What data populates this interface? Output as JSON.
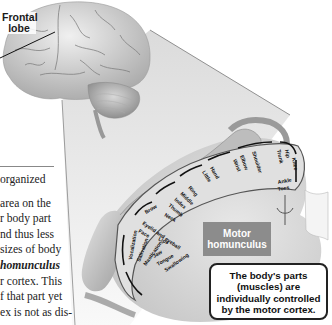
{
  "brain": {
    "label": "Frontal lobe",
    "label_lines": [
      "Frontal",
      "lobe"
    ]
  },
  "text_column": {
    "lines": [
      {
        "text": "organized",
        "style": "normal"
      },
      {
        "text": "area on the",
        "style": "normal"
      },
      {
        "text": "r body part",
        "style": "normal"
      },
      {
        "text": "nd thus less",
        "style": "normal"
      },
      {
        "text": "sizes of body",
        "style": "normal"
      },
      {
        "text": "homunculus",
        "style": "italic-bold"
      },
      {
        "text": "r cortex. This",
        "style": "normal"
      },
      {
        "text": "f that part yet",
        "style": "normal"
      },
      {
        "text": "ex is not as dis-",
        "style": "normal"
      }
    ]
  },
  "homunculus": {
    "body_parts": [
      "Toes",
      "Ankle",
      "Knee",
      "Hip",
      "Trunk",
      "Shoulder",
      "Elbow",
      "Wrist",
      "Hand",
      "Little",
      "Ring",
      "Middle",
      "Index",
      "Thumb",
      "Neck",
      "Brow",
      "Eyelid and eyeball",
      "Face",
      "Lips",
      "Jaw",
      "Tongue",
      "Swallowing",
      "Mastication",
      "Salivation",
      "Vocalization"
    ],
    "title_lines": [
      "Motor",
      "homunculus"
    ]
  },
  "callout": {
    "lines": [
      "The body's parts",
      "(muscles) are",
      "individually controlled",
      "by the motor cortex."
    ]
  },
  "colors": {
    "motor_box": "#8c8c8c",
    "callout_border": "#222222",
    "cone": "#e6e6e6"
  }
}
